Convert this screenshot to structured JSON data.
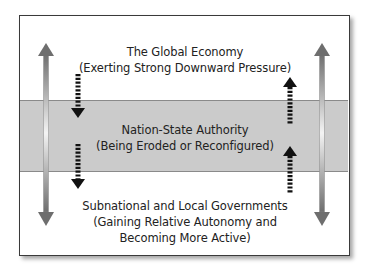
{
  "diagram": {
    "layers": [
      {
        "id": "global",
        "title": "The Global Economy",
        "subtitle_lines": [
          "(Exerting Strong Downward Pressure)"
        ],
        "background": "#ffffff"
      },
      {
        "id": "nation-state",
        "title": "Nation-State Authority",
        "subtitle_lines": [
          "(Being Eroded or Reconfigured)"
        ],
        "background": "#cbcbcb"
      },
      {
        "id": "subnational",
        "title": "Subnational and Local Governments",
        "subtitle_lines": [
          "(Gaining Relative Autonomy and",
          "Becoming More Active)"
        ],
        "background": "#ffffff"
      }
    ],
    "arrows": {
      "left_double": {
        "direction": "both",
        "style": "solid-gradient"
      },
      "right_double": {
        "direction": "both",
        "style": "solid-gradient"
      },
      "left_dashed": [
        {
          "direction": "down"
        },
        {
          "direction": "down"
        }
      ],
      "right_dashed": [
        {
          "direction": "up"
        },
        {
          "direction": "up"
        }
      ]
    },
    "colors": {
      "border": "#3a3a3a",
      "band": "#cbcbcb",
      "dashed_arrow": "#111111",
      "gradient_arrow_dark": "#6e6e6e",
      "gradient_arrow_light": "#f2f2f2"
    }
  }
}
